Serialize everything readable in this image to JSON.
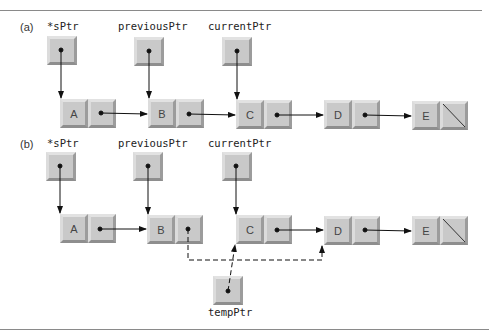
{
  "panels": [
    {
      "label": "(a)",
      "pointers": [
        {
          "name": "*sPtr",
          "points_to": "A"
        },
        {
          "name": "previousPtr",
          "points_to": "B"
        },
        {
          "name": "currentPtr",
          "points_to": "C"
        }
      ],
      "nodes": [
        {
          "data": "A",
          "next": "B"
        },
        {
          "data": "B",
          "next": "C"
        },
        {
          "data": "C",
          "next": "D"
        },
        {
          "data": "D",
          "next": "E"
        },
        {
          "data": "E",
          "next": null
        }
      ]
    },
    {
      "label": "(b)",
      "pointers": [
        {
          "name": "*sPtr",
          "points_to": "A"
        },
        {
          "name": "previousPtr",
          "points_to": "B"
        },
        {
          "name": "currentPtr",
          "points_to": "C"
        },
        {
          "name": "tempPtr",
          "points_to": "C"
        }
      ],
      "nodes": [
        {
          "data": "A",
          "next": "B"
        },
        {
          "data": "B",
          "next": "D",
          "link_style": "dashed"
        },
        {
          "data": "C",
          "next": "D"
        },
        {
          "data": "D",
          "next": "E"
        },
        {
          "data": "E",
          "next": null
        }
      ]
    }
  ],
  "colors": {
    "cell_face": "#c9c9c9",
    "line": "#111111",
    "rule": "#8a8a8a"
  }
}
